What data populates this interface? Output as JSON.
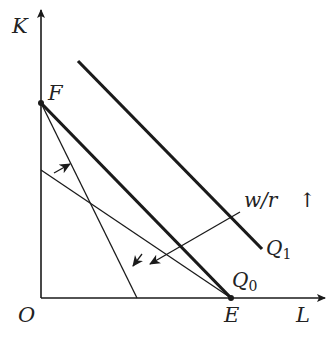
{
  "diagram": {
    "axes": {
      "y_label": "K",
      "x_label": "L",
      "origin_label": "O"
    },
    "points": {
      "F": "F",
      "E": "E"
    },
    "curves": {
      "q0_label": "Q",
      "q0_sub": "0",
      "q1_label": "Q",
      "q1_sub": "1"
    },
    "annotation": {
      "ratio": "w/r",
      "direction_glyph": "↑"
    },
    "caption": ""
  },
  "colors": {
    "ink": "#1a1a1a",
    "background": "#ffffff"
  }
}
